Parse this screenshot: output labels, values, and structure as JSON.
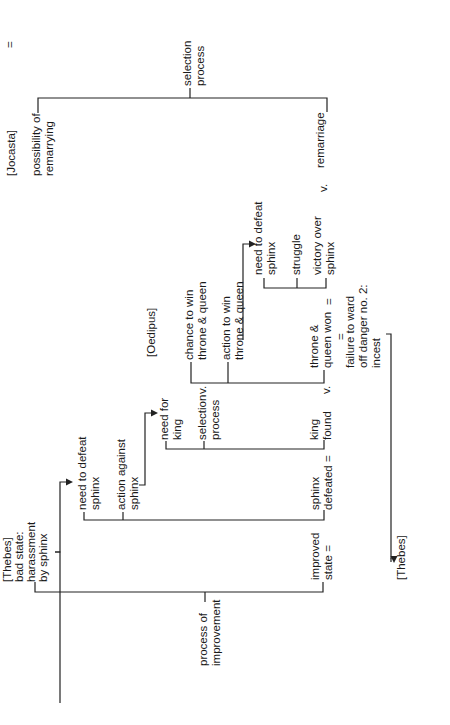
{
  "diagram": {
    "orientation": "rotated-90-ccw",
    "top_equals": "=",
    "jocasta": {
      "label": "[Jocasta]",
      "state_line1": "possibility of",
      "state_line2": "remarrying",
      "process_line1": "selection",
      "process_line2": "process",
      "result": "remarriage",
      "versus": "v."
    },
    "oedipus": {
      "label": "[Oedipus]",
      "chance_line1": "chance to win",
      "chance_line2": "throne & queen",
      "action_line1": "action to win",
      "action_line2": "throne & queen",
      "versus": "v.",
      "result_line1": "throne &",
      "result_line2": "queen won",
      "result_versus": "v.",
      "equals_right": "=",
      "equals_below": "=",
      "failure_line1": "failure to ward",
      "failure_line2": "off danger no. 2:",
      "failure_line3": "incest"
    },
    "sphinx_struggle": {
      "need_line1": "need to defeat",
      "need_line2": "sphinx",
      "struggle": "struggle",
      "victory_line1": "victory over",
      "victory_line2": "sphinx"
    },
    "king_selection": {
      "need_line1": "need for",
      "need_line2": "king",
      "process_line1": "selection",
      "process_line2": "process",
      "result_line1": "king",
      "result_line2": "found"
    },
    "thebes": {
      "label": "[Thebes]",
      "state_line1": "bad state:",
      "state_line2": "harassment",
      "state_line3": "by sphinx",
      "need_line1": "need to defeat",
      "need_line2": "sphinx",
      "action_line1": "action against",
      "action_line2": "sphinx",
      "defeated_line1": "sphinx",
      "defeated_line2": "defeated =",
      "process_line1": "process of",
      "process_line2": "improvement",
      "improved_line1": "improved",
      "improved_line2": "state =",
      "bottom_label": "[Thebes]"
    }
  }
}
